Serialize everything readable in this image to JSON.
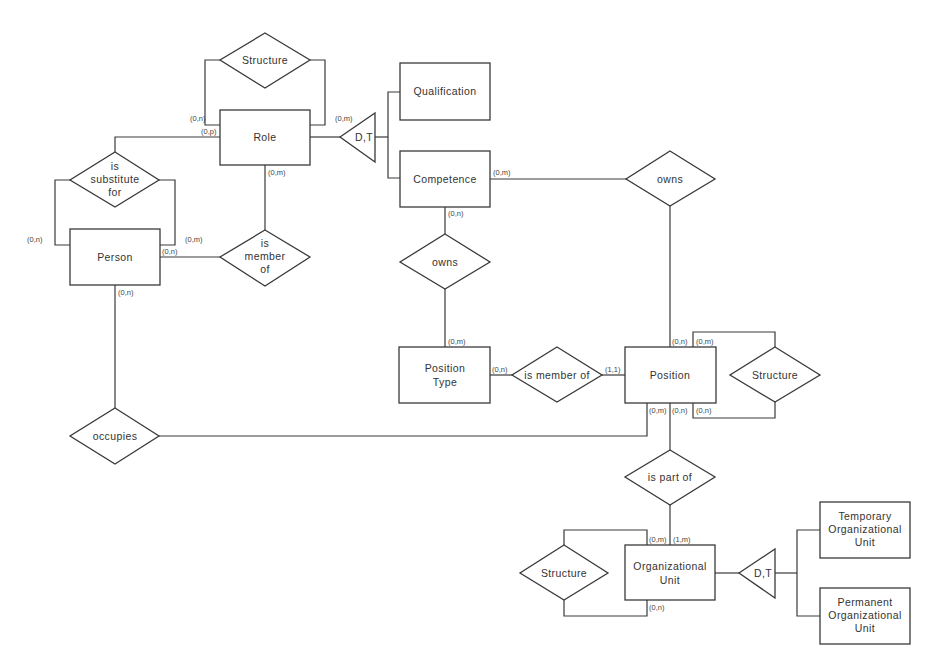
{
  "diagram": {
    "type": "entity-relationship",
    "entities": [
      {
        "id": "role",
        "label": [
          "Role"
        ]
      },
      {
        "id": "qualification",
        "label": [
          "Qualification"
        ]
      },
      {
        "id": "competence",
        "label": [
          "Competence"
        ]
      },
      {
        "id": "person",
        "label": [
          "Person"
        ]
      },
      {
        "id": "position_type",
        "label": [
          "Position",
          "Type"
        ]
      },
      {
        "id": "position",
        "label": [
          "Position"
        ]
      },
      {
        "id": "org_unit",
        "label": [
          "Organizational",
          "Unit"
        ]
      },
      {
        "id": "temp_org_unit",
        "label": [
          "Temporary",
          "Organizational",
          "Unit"
        ]
      },
      {
        "id": "perm_org_unit",
        "label": [
          "Permanent",
          "Organizational",
          "Unit"
        ]
      }
    ],
    "relationships": [
      {
        "id": "role_structure",
        "label": [
          "Structure"
        ]
      },
      {
        "id": "is_substitute_for",
        "label": [
          "is",
          "substitute",
          "for"
        ]
      },
      {
        "id": "is_member_of_role",
        "label": [
          "is",
          "member",
          "of"
        ]
      },
      {
        "id": "owns_competence_position",
        "label": [
          "owns"
        ]
      },
      {
        "id": "owns_competence_position_type",
        "label": [
          "owns"
        ]
      },
      {
        "id": "is_member_of_position_type",
        "label": [
          "is member of"
        ]
      },
      {
        "id": "position_structure",
        "label": [
          "Structure"
        ]
      },
      {
        "id": "occupies",
        "label": [
          "occupies"
        ]
      },
      {
        "id": "is_part_of",
        "label": [
          "is part of"
        ]
      },
      {
        "id": "org_structure",
        "label": [
          "Structure"
        ]
      }
    ],
    "generalizations": [
      {
        "id": "role_gen",
        "label": "D,T"
      },
      {
        "id": "org_gen",
        "label": "D,T"
      }
    ],
    "cardinalities": {
      "role_structure_left": "(0,n)",
      "role_substitute": "(0,p)",
      "role_structure_right": "(0,m)",
      "role_member": "(0,m)",
      "person_substitute_left": "(0,n)",
      "person_substitute_right": "(0,m)",
      "person_member": "(0,n)",
      "person_occupies": "(0,n)",
      "competence_owns_position": "(0,m)",
      "competence_owns_type": "(0,n)",
      "position_type_owns": "(0,m)",
      "position_type_member": "(0,n)",
      "position_member": "(1,1)",
      "position_owns": "(0,n)",
      "position_structure_top": "(0,m)",
      "position_occupies": "(0,m)",
      "position_part_of": "(0,n)",
      "position_structure_bottom": "(0,n)",
      "org_structure_top": "(0,m)",
      "org_part_of": "(1,m)",
      "org_structure_bottom": "(0,n)"
    }
  }
}
